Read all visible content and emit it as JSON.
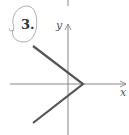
{
  "problem": {
    "number": "3.",
    "circled": true
  },
  "axes": {
    "x_label": "x",
    "y_label": "y"
  },
  "graph": {
    "type": "piecewise-linear",
    "shape": "leftward-opening V (like x = |y| shifted)",
    "vertex": {
      "px": 83,
      "py": 84
    },
    "upper_ray_end": {
      "px": 33,
      "py": 46
    },
    "lower_ray_end": {
      "px": 33,
      "py": 123
    },
    "line_color": "#555555",
    "axis_color": "#888888"
  }
}
